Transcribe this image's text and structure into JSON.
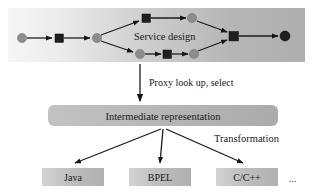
{
  "figure": {
    "background_color": "#ffffff",
    "width": 330,
    "height": 196
  },
  "band": {
    "name": "service-design-band",
    "label": "Service design",
    "gradient_from": "#f4f4f4",
    "gradient_to": "#b2b2b2",
    "x": 8,
    "y": 8,
    "width": 297,
    "height": 54
  },
  "graph": {
    "node_gray_color": "#8c8c8c",
    "node_dark_color": "#1f1f1f",
    "nodes": [
      {
        "id": "n0",
        "shape": "circle",
        "fill": "gray",
        "cx": 22,
        "cy": 38,
        "r": 4.5
      },
      {
        "id": "n1",
        "shape": "square",
        "fill": "dark",
        "cx": 59,
        "cy": 38,
        "size": 8
      },
      {
        "id": "n2",
        "shape": "circle",
        "fill": "gray",
        "cx": 97,
        "cy": 38,
        "r": 4.5
      },
      {
        "id": "n3",
        "shape": "square",
        "fill": "dark",
        "cx": 146,
        "cy": 18,
        "size": 8
      },
      {
        "id": "n4",
        "shape": "circle",
        "fill": "gray",
        "cx": 193,
        "cy": 18,
        "r": 4.5
      },
      {
        "id": "n5",
        "shape": "circle",
        "fill": "gray",
        "cx": 140,
        "cy": 54,
        "r": 4.5
      },
      {
        "id": "n6",
        "shape": "square",
        "fill": "dark",
        "cx": 167,
        "cy": 54,
        "size": 8
      },
      {
        "id": "n7",
        "shape": "circle",
        "fill": "gray",
        "cx": 194,
        "cy": 54,
        "r": 4.5
      },
      {
        "id": "n8",
        "shape": "square",
        "fill": "dark",
        "cx": 233,
        "cy": 36,
        "size": 9
      },
      {
        "id": "n9",
        "shape": "circle",
        "fill": "dark",
        "cx": 285,
        "cy": 36,
        "r": 5
      }
    ],
    "edges": [
      {
        "from": "n0",
        "to": "n1"
      },
      {
        "from": "n1",
        "to": "n2"
      },
      {
        "from": "n2",
        "to": "n3"
      },
      {
        "from": "n2",
        "to": "n5"
      },
      {
        "from": "n3",
        "to": "n4"
      },
      {
        "from": "n5",
        "to": "n6"
      },
      {
        "from": "n6",
        "to": "n7"
      },
      {
        "from": "n4",
        "to": "n8"
      },
      {
        "from": "n7",
        "to": "n8"
      },
      {
        "from": "n8",
        "to": "n9"
      }
    ]
  },
  "proxy_step": {
    "arrow_name": "proxy-lookup-arrow",
    "label": "Proxy look up, select",
    "label_x": 148,
    "label_y": 85,
    "arrow_x": 140,
    "arrow_y_start": 63,
    "arrow_y_end": 102
  },
  "intermediate": {
    "label": "Intermediate representation",
    "fill": "#b8b8b8",
    "x": 48,
    "y": 105,
    "width": 230,
    "height": 21,
    "radius": 6
  },
  "transformation": {
    "label": "Transformation",
    "label_x": 214,
    "label_y": 141
  },
  "targets": {
    "boxes": [
      {
        "label": "Java",
        "x": 42,
        "y": 168,
        "width": 62,
        "height": 18
      },
      {
        "label": "BPEL",
        "x": 129,
        "y": 168,
        "width": 62,
        "height": 18
      },
      {
        "label": "C/C++",
        "x": 216,
        "y": 168,
        "width": 62,
        "height": 18
      }
    ],
    "ellipsis": "...",
    "ellipsis_x": 291,
    "ellipsis_y": 181,
    "fan_origin_x": 163,
    "fan_origin_y": 128
  }
}
